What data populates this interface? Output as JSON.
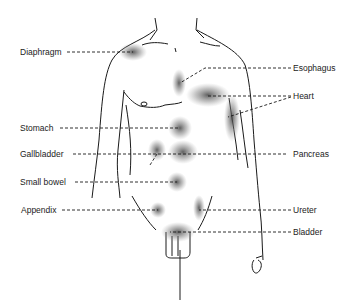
{
  "figure": {
    "line_color": "#1a1a1a",
    "shading_color": "#555555"
  },
  "labels_left": [
    {
      "id": "diaphragm",
      "text": "Diaphragm",
      "x": 20,
      "y": 47
    },
    {
      "id": "stomach",
      "text": "Stomach",
      "x": 20,
      "y": 123
    },
    {
      "id": "gallbladder",
      "text": "Gallbladder",
      "x": 20,
      "y": 151
    },
    {
      "id": "small-bowel",
      "text": "Small bowel",
      "x": 20,
      "y": 178
    },
    {
      "id": "appendix",
      "text": "Appendix",
      "x": 21,
      "y": 207
    }
  ],
  "labels_right": [
    {
      "id": "esophagus",
      "text": "Esophagus",
      "x": 294,
      "y": 63
    },
    {
      "id": "heart",
      "text": "Heart",
      "x": 294,
      "y": 92
    },
    {
      "id": "pancreas",
      "text": "Pancreas",
      "x": 294,
      "y": 151
    },
    {
      "id": "ureter",
      "text": "Ureter",
      "x": 294,
      "y": 206
    },
    {
      "id": "bladder",
      "text": "Bladder",
      "x": 294,
      "y": 228
    }
  ]
}
